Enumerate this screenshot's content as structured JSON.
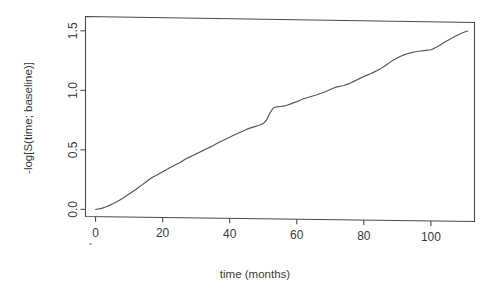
{
  "chart_data": {
    "type": "line",
    "title": "",
    "subtitle": "",
    "xlabel": "time (months)",
    "ylabel": "-log[S(time; baseline)]",
    "xlim": [
      -3,
      113
    ],
    "ylim": [
      -0.06,
      1.62
    ],
    "xticks": [
      0,
      20,
      40,
      60,
      80,
      100
    ],
    "xtick_labels": [
      "0",
      "20",
      "40",
      "60",
      "80",
      "100"
    ],
    "yticks": [
      0.0,
      0.5,
      1.0,
      1.5
    ],
    "ytick_labels": [
      "0.0",
      "0.5",
      "1.0",
      "1.5"
    ],
    "grid": false,
    "legend": null,
    "legend_position": "none",
    "annotations": [],
    "line_color": "#555555",
    "axis_color": "#4a4a4a",
    "background": "#ffffff",
    "series": [
      {
        "name": "cumulative baseline hazard",
        "x": [
          0,
          1,
          2,
          3,
          4,
          5,
          6,
          7,
          8,
          9,
          10,
          11,
          12,
          13,
          14,
          15,
          16,
          17,
          18,
          19,
          20,
          21,
          22,
          23,
          24,
          25,
          26,
          27,
          28,
          29,
          30,
          31,
          32,
          33,
          34,
          35,
          36,
          37,
          38,
          39,
          40,
          41,
          42,
          43,
          44,
          45,
          46,
          47,
          48,
          49,
          50,
          51,
          52,
          53,
          54,
          55,
          56,
          57,
          58,
          59,
          60,
          61,
          62,
          63,
          64,
          65,
          66,
          67,
          68,
          69,
          70,
          71,
          72,
          73,
          74,
          75,
          76,
          77,
          78,
          79,
          80,
          81,
          82,
          83,
          84,
          85,
          86,
          87,
          88,
          89,
          90,
          91,
          92,
          93,
          94,
          95,
          96,
          97,
          98,
          99,
          100,
          101,
          102,
          103,
          104,
          105,
          106,
          107,
          108,
          109,
          110,
          111
        ],
        "y": [
          0.0,
          0.005,
          0.012,
          0.022,
          0.034,
          0.048,
          0.063,
          0.079,
          0.096,
          0.114,
          0.133,
          0.153,
          0.173,
          0.193,
          0.214,
          0.236,
          0.258,
          0.276,
          0.292,
          0.308,
          0.324,
          0.34,
          0.356,
          0.372,
          0.386,
          0.4,
          0.418,
          0.436,
          0.45,
          0.464,
          0.478,
          0.492,
          0.506,
          0.52,
          0.534,
          0.549,
          0.565,
          0.58,
          0.594,
          0.608,
          0.622,
          0.636,
          0.65,
          0.663,
          0.676,
          0.689,
          0.7,
          0.709,
          0.718,
          0.728,
          0.74,
          0.77,
          0.83,
          0.872,
          0.882,
          0.885,
          0.888,
          0.896,
          0.906,
          0.917,
          0.928,
          0.94,
          0.952,
          0.962,
          0.97,
          0.979,
          0.988,
          0.998,
          1.008,
          1.02,
          1.034,
          1.046,
          1.056,
          1.062,
          1.068,
          1.078,
          1.09,
          1.104,
          1.118,
          1.132,
          1.146,
          1.158,
          1.17,
          1.184,
          1.198,
          1.214,
          1.232,
          1.252,
          1.272,
          1.29,
          1.306,
          1.32,
          1.332,
          1.342,
          1.35,
          1.357,
          1.362,
          1.366,
          1.37,
          1.374,
          1.378,
          1.39,
          1.406,
          1.424,
          1.442,
          1.458,
          1.474,
          1.49,
          1.505,
          1.518,
          1.53,
          1.54
        ]
      }
    ]
  },
  "axes": {
    "x_title": "time (months)",
    "y_title": "-log[S(time; baseline)]"
  }
}
